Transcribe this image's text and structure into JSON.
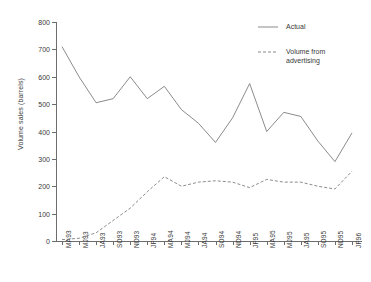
{
  "chart_data": {
    "type": "line",
    "title": "",
    "xlabel": "",
    "ylabel": "Volume sales (barrels)",
    "ylim": [
      0,
      800
    ],
    "ytick_values": [
      0,
      100,
      200,
      300,
      400,
      500,
      600,
      700,
      800
    ],
    "ytick_labels": [
      "0",
      "100",
      "200",
      "300",
      "400",
      "500",
      "600",
      "700",
      "800"
    ],
    "grid": false,
    "legend_position": "top-right",
    "categories": [
      "MA93",
      "MJ93",
      "JA93",
      "SO93",
      "ND93",
      "JF94",
      "MA94",
      "MJ94",
      "JA94",
      "SO94",
      "ND94",
      "JF95",
      "MA95",
      "MJ95",
      "JA95",
      "SO95",
      "ND95",
      "JF96"
    ],
    "series": [
      {
        "name": "Actual",
        "style": "solid",
        "values": [
          710,
          600,
          505,
          520,
          600,
          520,
          565,
          480,
          430,
          360,
          450,
          575,
          400,
          470,
          455,
          365,
          290,
          395
        ]
      },
      {
        "name": "Volume from advertising",
        "style": "dashed",
        "values": [
          5,
          10,
          30,
          75,
          120,
          180,
          235,
          200,
          215,
          220,
          215,
          195,
          225,
          215,
          215,
          200,
          190,
          255
        ]
      }
    ]
  },
  "legend": {
    "entries": [
      {
        "label": "Actual",
        "style": "solid"
      },
      {
        "label": "Volume from\nadvertising",
        "style": "dashed"
      }
    ]
  }
}
